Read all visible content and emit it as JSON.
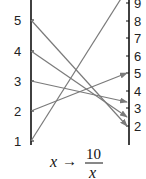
{
  "diagram": {
    "left_axis": {
      "labels": [
        "1",
        "2",
        "3",
        "4",
        "5"
      ],
      "values": [
        1,
        2,
        3,
        4,
        5
      ]
    },
    "right_axis": {
      "labels": [
        "2",
        "3",
        "4",
        "5",
        "6",
        "7",
        "8",
        "9"
      ],
      "values": [
        2,
        3,
        4,
        5,
        6,
        7,
        8,
        9
      ]
    },
    "mappings": [
      {
        "from": 1,
        "to": 10
      },
      {
        "from": 2,
        "to": 5
      },
      {
        "from": 3,
        "to": 3.33
      },
      {
        "from": 4,
        "to": 2.5
      },
      {
        "from": 5,
        "to": 2
      }
    ],
    "formula": {
      "variable": "x",
      "arrow": "→",
      "numerator": "10",
      "denominator": "x"
    },
    "colors": {
      "axis": "#111111",
      "arrow": "#7a7a7a",
      "text": "#222222"
    }
  }
}
